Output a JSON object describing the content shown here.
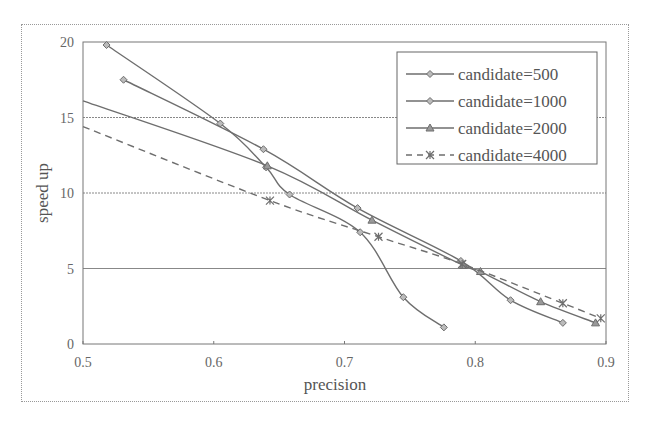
{
  "chart_data": {
    "type": "line",
    "title": "",
    "xlabel": "precision",
    "ylabel": "speed up",
    "xlim": [
      0.5,
      0.9
    ],
    "ylim": [
      0,
      20
    ],
    "xticks": [
      "0.5",
      "0.6",
      "0.7",
      "0.8",
      "0.9"
    ],
    "yticks": [
      "0",
      "5",
      "10",
      "15",
      "20"
    ],
    "grid": "horizontal",
    "legend_position": "upper right",
    "series": [
      {
        "name": "candidate=500",
        "marker": "diamond",
        "linestyle": "solid",
        "x": [
          0.518,
          0.605,
          0.64,
          0.658,
          0.712,
          0.745,
          0.776
        ],
        "y": [
          19.8,
          14.6,
          11.7,
          9.9,
          7.4,
          3.1,
          1.1
        ]
      },
      {
        "name": "candidate=1000",
        "marker": "diamond",
        "linestyle": "solid",
        "x": [
          0.531,
          0.638,
          0.71,
          0.789,
          0.827,
          0.867
        ],
        "y": [
          17.5,
          12.9,
          9.0,
          5.5,
          2.9,
          1.4
        ]
      },
      {
        "name": "candidate=2000",
        "marker": "triangle",
        "linestyle": "solid",
        "x": [
          0.5,
          0.641,
          0.721,
          0.791,
          0.804,
          0.85,
          0.892
        ],
        "y": [
          16.1,
          11.8,
          8.2,
          5.2,
          4.8,
          2.8,
          1.4
        ]
      },
      {
        "name": "candidate=4000",
        "marker": "x-star",
        "linestyle": "dashed",
        "x": [
          0.5,
          0.643,
          0.726,
          0.79,
          0.867,
          0.896
        ],
        "y": [
          14.4,
          9.5,
          7.1,
          5.3,
          2.7,
          1.7
        ]
      }
    ]
  },
  "axes": {
    "xlabel": "precision",
    "ylabel": "speed up"
  },
  "legend": [
    {
      "label": "candidate=500"
    },
    {
      "label": "candidate=1000"
    },
    {
      "label": "candidate=2000"
    },
    {
      "label": "candidate=4000"
    }
  ],
  "colors": {
    "line": "#6e6e6e",
    "grid": "#888888",
    "text": "#555555"
  }
}
